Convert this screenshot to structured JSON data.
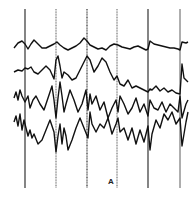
{
  "figure": {
    "panel_label": "A",
    "background": "#ffffff",
    "trace_color": "#111111",
    "marker_color": "#333333"
  },
  "chart_data": {
    "type": "line",
    "title": "",
    "xlabel": "",
    "ylabel": "",
    "grid": false,
    "legend": null,
    "annotations": [
      "A"
    ],
    "time_markers_px": [
      25,
      56,
      87,
      117,
      148,
      180
    ],
    "series": [
      {
        "name": "channel-1",
        "baseline_px": 46,
        "x": [
          14,
          18,
          22,
          25,
          28,
          31,
          34,
          38,
          42,
          46,
          50,
          54,
          57,
          60,
          64,
          68,
          72,
          76,
          80,
          84,
          87,
          90,
          94,
          98,
          102,
          106,
          110,
          114,
          118,
          122,
          126,
          130,
          134,
          138,
          142,
          146,
          148,
          150,
          154,
          158,
          162,
          166,
          170,
          174,
          178,
          180,
          182,
          186,
          188
        ],
        "values": [
          48,
          43,
          41,
          44,
          49,
          44,
          40,
          44,
          48,
          48,
          46,
          44,
          42,
          45,
          48,
          50,
          48,
          46,
          43,
          38,
          41,
          45,
          47,
          49,
          48,
          50,
          46,
          44,
          45,
          47,
          48,
          49,
          47,
          46,
          48,
          50,
          49,
          41,
          44,
          45,
          46,
          47,
          48,
          48,
          49,
          50,
          42,
          43,
          42
        ]
      },
      {
        "name": "channel-2",
        "baseline_px": 70,
        "x": [
          14,
          18,
          22,
          25,
          28,
          31,
          34,
          38,
          42,
          46,
          50,
          54,
          56,
          58,
          60,
          62,
          64,
          68,
          72,
          76,
          80,
          84,
          87,
          90,
          94,
          98,
          102,
          106,
          110,
          114,
          117,
          120,
          124,
          128,
          132,
          136,
          140,
          144,
          148,
          150,
          152,
          156,
          160,
          164,
          168,
          172,
          176,
          180,
          182,
          184,
          188
        ],
        "values": [
          72,
          70,
          71,
          68,
          69,
          67,
          72,
          74,
          70,
          66,
          70,
          79,
          60,
          56,
          66,
          78,
          72,
          75,
          80,
          78,
          70,
          62,
          56,
          60,
          72,
          66,
          58,
          62,
          72,
          80,
          76,
          84,
          86,
          80,
          88,
          86,
          88,
          90,
          92,
          89,
          90,
          86,
          91,
          88,
          92,
          90,
          93,
          94,
          64,
          78,
          82
        ]
      },
      {
        "name": "channel-3",
        "baseline_px": 100,
        "x": [
          14,
          16,
          18,
          20,
          22,
          25,
          28,
          30,
          33,
          36,
          40,
          44,
          48,
          52,
          54,
          56,
          58,
          60,
          62,
          64,
          66,
          70,
          74,
          78,
          82,
          86,
          88,
          90,
          92,
          96,
          100,
          104,
          108,
          112,
          116,
          118,
          120,
          124,
          128,
          132,
          136,
          140,
          144,
          148,
          150,
          154,
          158,
          162,
          166,
          170,
          174,
          178,
          180,
          182,
          186,
          188
        ],
        "values": [
          98,
          92,
          100,
          90,
          96,
          102,
          96,
          108,
          100,
          96,
          104,
          110,
          98,
          86,
          100,
          118,
          98,
          82,
          96,
          112,
          104,
          90,
          100,
          112,
          104,
          90,
          110,
          94,
          104,
          96,
          110,
          102,
          118,
          108,
          100,
          112,
          96,
          104,
          114,
          108,
          98,
          112,
          104,
          116,
          100,
          108,
          110,
          102,
          112,
          104,
          108,
          112,
          96,
          118,
          104,
          100
        ]
      },
      {
        "name": "channel-4",
        "baseline_px": 126,
        "x": [
          14,
          16,
          18,
          20,
          22,
          24,
          26,
          28,
          30,
          32,
          34,
          38,
          42,
          46,
          50,
          54,
          56,
          58,
          60,
          62,
          64,
          66,
          68,
          72,
          76,
          80,
          84,
          88,
          90,
          92,
          96,
          100,
          104,
          108,
          112,
          116,
          118,
          120,
          124,
          128,
          132,
          136,
          140,
          144,
          148,
          150,
          152,
          156,
          160,
          164,
          168,
          172,
          176,
          180,
          182,
          186,
          188
        ],
        "values": [
          122,
          116,
          126,
          114,
          130,
          120,
          128,
          136,
          130,
          138,
          134,
          144,
          140,
          130,
          120,
          132,
          152,
          136,
          124,
          144,
          128,
          136,
          150,
          140,
          128,
          118,
          128,
          138,
          112,
          124,
          132,
          124,
          128,
          118,
          134,
          124,
          118,
          132,
          128,
          140,
          128,
          144,
          130,
          142,
          126,
          150,
          134,
          120,
          128,
          114,
          120,
          112,
          124,
          118,
          146,
          122,
          112
        ]
      }
    ]
  }
}
